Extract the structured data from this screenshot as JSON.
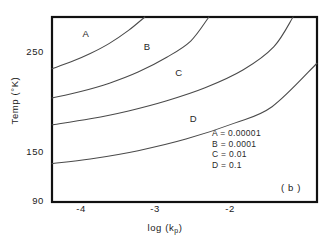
{
  "panel_tag": "( b )",
  "chart_data": {
    "type": "line",
    "title": "",
    "subtitle": "",
    "xlabel": "log (k",
    "xlabel_sub": "p",
    "xlabel_close": ")",
    "ylabel": "Temp (°K)",
    "xlim": [
      -4.4,
      -1.63
    ],
    "ylim": [
      90,
      290
    ],
    "grid": false,
    "legend_position": "inside-lower-right",
    "xticks": [
      -4,
      -3,
      -2
    ],
    "xtick_labels": [
      "-4",
      "-3",
      "-2"
    ],
    "yticks": [
      90,
      150,
      250
    ],
    "ytick_labels": [
      "90",
      "150",
      "250"
    ],
    "series": [
      {
        "name": "A",
        "legend_label": "A  = 0.00001",
        "value": 1e-05,
        "label_x": -4.05,
        "label_y": 272,
        "x": [
          -4.4,
          -4.2,
          -4.0,
          -3.8,
          -3.6,
          -3.43
        ],
        "y": [
          234.0,
          241.5,
          250.5,
          261.5,
          275.5,
          290.0
        ]
      },
      {
        "name": "B",
        "legend_label": "B  = 0.0001",
        "value": 0.0001,
        "label_x": -3.41,
        "label_y": 258,
        "x": [
          -4.4,
          -4.1,
          -3.8,
          -3.5,
          -3.2,
          -2.95,
          -2.76
        ],
        "y": [
          202.5,
          209.5,
          218.5,
          230.5,
          246.5,
          264.0,
          290.0
        ]
      },
      {
        "name": "C",
        "legend_label": "C  = 0.01",
        "value": 0.01,
        "label_x": -3.08,
        "label_y": 230,
        "x": [
          -4.4,
          -4.0,
          -3.6,
          -3.2,
          -2.8,
          -2.4,
          -2.08,
          -1.88
        ],
        "y": [
          173.5,
          180.0,
          188.5,
          199.5,
          213.5,
          233.0,
          258.0,
          290.0
        ]
      },
      {
        "name": "D",
        "legend_label": "D  = 0.1",
        "value": 0.1,
        "label_x": -2.93,
        "label_y": 180,
        "x": [
          -4.4,
          -4.0,
          -3.5,
          -3.0,
          -2.5,
          -2.1,
          -1.63
        ],
        "y": [
          131.5,
          136.5,
          145.5,
          158.0,
          175.0,
          193.0,
          240.0
        ]
      }
    ]
  }
}
